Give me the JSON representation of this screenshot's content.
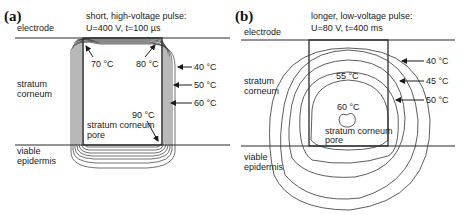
{
  "panels": [
    {
      "id": "a",
      "tag": "(a)",
      "title_line1": "short, high-voltage pulse:",
      "title_line2": "U=400 V, t=100 µs",
      "layers": {
        "top": "electrode",
        "middle_1": "stratum",
        "middle_2": "corneum",
        "bottom_1": "viable",
        "bottom_2": "epidermis"
      },
      "pore_label_1": "stratum corneum",
      "pore_label_2": "pore",
      "isotherms": [
        "40 °C",
        "50 °C",
        "60 °C",
        "70 °C",
        "80 °C",
        "90 °C"
      ]
    },
    {
      "id": "b",
      "tag": "(b)",
      "title_line1": "longer, low-voltage pulse:",
      "title_line2": "U=80 V, t=400 ms",
      "layers": {
        "top": "electrode",
        "middle_1": "stratum",
        "middle_2": "corneum",
        "bottom_1": "viable",
        "bottom_2": "epidermis"
      },
      "pore_label_1": "stratum corneum",
      "pore_label_2": "pore",
      "isotherms": [
        "40 °C",
        "45 °C",
        "50 °C",
        "55 °C",
        "60 °C"
      ]
    }
  ]
}
